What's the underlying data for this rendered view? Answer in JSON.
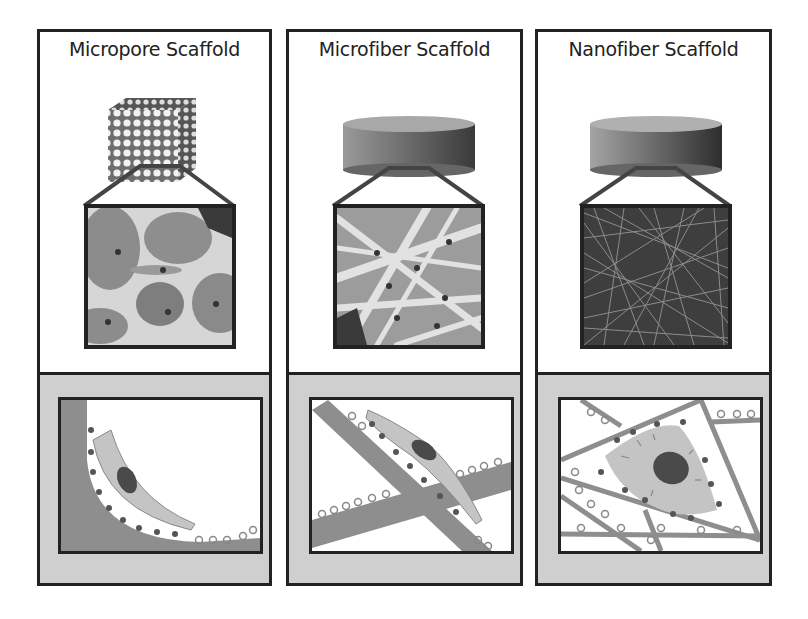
{
  "figure": {
    "panels": [
      {
        "id": "micropore",
        "title": "Micropore Scaffold",
        "macro_shape": "porous-cube",
        "micro_view": "pores-with-cells",
        "schematic": "cell-curved-in-pore"
      },
      {
        "id": "microfiber",
        "title": "Microfiber Scaffold",
        "macro_shape": "disc",
        "micro_view": "thick-fibers-with-cells",
        "schematic": "cell-elongated-on-fiber"
      },
      {
        "id": "nanofiber",
        "title": "Nanofiber Scaffold",
        "macro_shape": "disc",
        "micro_view": "dense-nanofiber-mesh",
        "schematic": "cell-spread-on-nanofibers"
      }
    ],
    "colors": {
      "border": "#222222",
      "panel_bg": "#ffffff",
      "schematic_bg": "#cfcfcf",
      "scaffold_gray": "#8a8a8a",
      "cell_body": "#c4c4c4",
      "nucleus": "#4a4a4a"
    }
  }
}
